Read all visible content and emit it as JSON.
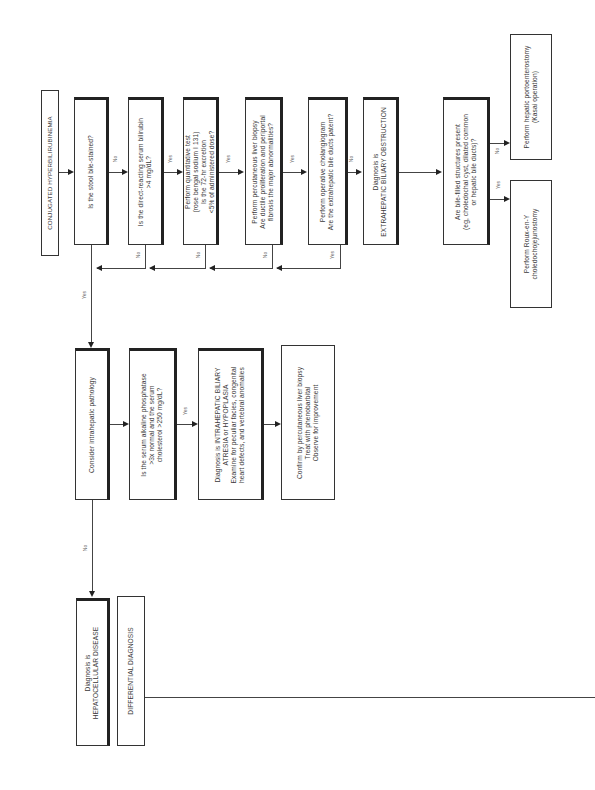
{
  "title": "CONJUGATED HYPERBILIRUBINEMIA",
  "nodes": {
    "start": "CONJUGATED HYPERBILIRUBINEMIA",
    "stool": "Is the stool bile-stained?",
    "bilirubin": "Is the direct-reacting serum bilirubin\n>4 mg/dL?",
    "quant_test": "Perform quantitative test\n(rose bengal sodium I 131)\nIs the 72-hr excretion\n<5% of administered dose?",
    "liver_biopsy": "Perform percutaneous liver biopsy\nAre ductile proliferation and periportal\nfibrosis the major abnormalities?",
    "cholangiogram": "Perform operative cholangiogram\nAre the extrahepatic bile ducts patent?",
    "extrahepatic": "Diagnosis is\nEXTRAHEPATIC BILIARY OBSTRUCTION",
    "bile_structures": "Are bile-filled structures present\n(eg, choledochal cyst, dilated common\nor hepatic bile ducts)?",
    "kasai": "Perform hepatic portoenterostomy\n(Kasai operation)",
    "roux": "Perform Roux-en-Y\ncholedochojejunostomy",
    "intrahepatic": "Consider intrahepatic pathology",
    "alk_phos": "Is the serum alkaline phosphatase\n>3x normal and the serum\ncholesterol >250 mg/dL?",
    "intra_diag": "Diagnosis is INTRAHEPATIC BILIARY\nATRESIA or HYPOPLASIA\nExamine for peculiar facies, congenital\nheart defects, and vertebral anomalies",
    "confirm": "Confirm by percutaneous liver biopsy\nTreat with phenobarbital\nObserve for improvement",
    "hepatocellular": "Diagnosis is\nHEPATOCELLULAR DISEASE",
    "differential": "DIFFERENTIAL DIAGNOSIS"
  },
  "edge_labels": {
    "stool_no": "No",
    "stool_yes": "Yes",
    "bili_yes": "Yes",
    "bili_no": "No",
    "quant_yes": "Yes",
    "quant_no": "No",
    "biopsy_yes": "Yes",
    "biopsy_no": "No",
    "chol_no": "No",
    "chol_yes": "Yes",
    "bile_no": "No",
    "bile_yes": "Yes",
    "intra_no": "No",
    "alk_yes": "Yes"
  }
}
